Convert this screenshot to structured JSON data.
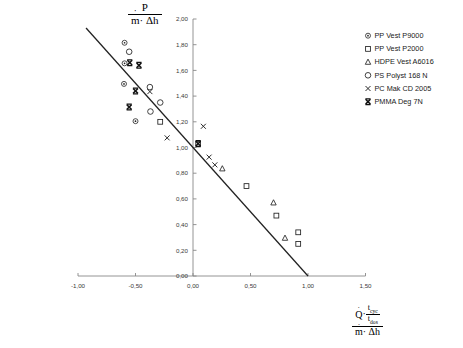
{
  "chart_data": {
    "type": "scatter",
    "title": "",
    "subtitle": "",
    "xlabel": "(Q̇ · t_cyc / t_dos) / (ṁ · Δh)",
    "ylabel": "P / (ṁ · Δh)",
    "xlim": [
      -1.0,
      1.5
    ],
    "ylim": [
      0.0,
      2.0
    ],
    "xticks": [
      -1.0,
      -0.5,
      0.0,
      0.5,
      1.0,
      1.5
    ],
    "yticks": [
      0.0,
      0.2,
      0.4,
      0.6,
      0.8,
      1.0,
      1.2,
      1.4,
      1.6,
      1.8,
      2.0
    ],
    "xtick_labels": [
      "-1,00",
      "-0,50",
      "0,00",
      "0,50",
      "1,00",
      "1,50"
    ],
    "ytick_labels": [
      "0,00",
      "0,20",
      "0,40",
      "0,60",
      "0,80",
      "1,00",
      "1,20",
      "1,40",
      "1,60",
      "1,80",
      "2,00"
    ],
    "grid": false,
    "legend_position": "top-right",
    "decimal_separator": ",",
    "trendline": {
      "name": "regression-line",
      "x": [
        -0.93,
        1.0
      ],
      "y": [
        1.93,
        0.0
      ],
      "color": "#222222"
    },
    "series": [
      {
        "name": "PP Vest P9000",
        "marker": "circle-dot",
        "color": "#222222",
        "points": [
          {
            "x": -0.595,
            "y": 1.815
          },
          {
            "x": -0.595,
            "y": 1.655
          },
          {
            "x": -0.6,
            "y": 1.495
          },
          {
            "x": -0.5,
            "y": 1.205
          }
        ]
      },
      {
        "name": "PP Vest P2000",
        "marker": "square",
        "color": "#222222",
        "points": [
          {
            "x": -0.285,
            "y": 1.2
          },
          {
            "x": 0.045,
            "y": 1.03
          },
          {
            "x": 0.465,
            "y": 0.7
          },
          {
            "x": 0.725,
            "y": 0.47
          },
          {
            "x": 0.915,
            "y": 0.34
          },
          {
            "x": 0.915,
            "y": 0.25
          }
        ]
      },
      {
        "name": "HDPE Vest A6016",
        "marker": "triangle",
        "color": "#222222",
        "points": [
          {
            "x": 0.255,
            "y": 0.835
          },
          {
            "x": 0.7,
            "y": 0.57
          },
          {
            "x": 0.8,
            "y": 0.295
          }
        ]
      },
      {
        "name": "PS Polyst 168 N",
        "marker": "circle",
        "color": "#222222",
        "points": [
          {
            "x": -0.555,
            "y": 1.745
          },
          {
            "x": -0.375,
            "y": 1.47
          },
          {
            "x": -0.37,
            "y": 1.28
          },
          {
            "x": -0.285,
            "y": 1.35
          }
        ]
      },
      {
        "name": "PC Mak CD 2005",
        "marker": "cross",
        "color": "#222222",
        "points": [
          {
            "x": -0.375,
            "y": 1.435
          },
          {
            "x": -0.225,
            "y": 1.075
          },
          {
            "x": 0.09,
            "y": 1.165
          },
          {
            "x": 0.14,
            "y": 0.925
          },
          {
            "x": 0.19,
            "y": 0.865
          }
        ]
      },
      {
        "name": "PMMA Deg 7N",
        "marker": "cross-bold",
        "color": "#111111",
        "points": [
          {
            "x": -0.55,
            "y": 1.66
          },
          {
            "x": -0.47,
            "y": 1.64
          },
          {
            "x": -0.5,
            "y": 1.44
          },
          {
            "x": -0.555,
            "y": 1.315
          },
          {
            "x": 0.045,
            "y": 1.03
          }
        ]
      }
    ]
  },
  "legend": {
    "items": [
      {
        "label": "PP Vest P9000",
        "marker": "circle-dot"
      },
      {
        "label": "PP Vest P2000",
        "marker": "square"
      },
      {
        "label": "HDPE Vest A6016",
        "marker": "triangle"
      },
      {
        "label": "PS Polyst 168 N",
        "marker": "circle"
      },
      {
        "label": "PC Mak CD 2005",
        "marker": "cross"
      },
      {
        "label": "PMMA Deg 7N",
        "marker": "cross-bold"
      }
    ]
  },
  "axis_labels": {
    "y": {
      "numerator": "P",
      "denominator_m": "m",
      "denominator_rest": "· Δh"
    },
    "x": {
      "q_symbol": "Q",
      "dot": "·",
      "t_cyc": "t",
      "t_cyc_sub": "cyc",
      "t_dos": "t",
      "t_dos_sub": "dos",
      "denominator_m": "m",
      "denominator_rest": "· Δh"
    }
  }
}
